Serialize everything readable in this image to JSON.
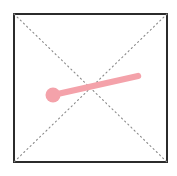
{
  "canvas": {
    "width": 177,
    "height": 176,
    "background_color": "#ffffff"
  },
  "figure": {
    "name": "square-with-diagonals-and-pink-vector",
    "square": {
      "label": "bounding-square",
      "x": 14,
      "y": 14,
      "width": 153,
      "height": 148,
      "stroke_color": "#2b2b2b",
      "stroke_width": 2,
      "fill_color": "#ffffff",
      "corners": {
        "top_left": [
          14,
          14
        ],
        "top_right": [
          167,
          14
        ],
        "bottom_right": [
          167,
          162
        ],
        "bottom_left": [
          14,
          162
        ]
      }
    },
    "diagonals": {
      "label": "dotted-diagonals",
      "stroke_color": "#8a8a8a",
      "stroke_width": 1,
      "dash_pattern": "1,3",
      "lines": [
        {
          "name": "diagonal-tl-br",
          "x1": 14,
          "y1": 14,
          "x2": 167,
          "y2": 162
        },
        {
          "name": "diagonal-tr-bl",
          "x1": 167,
          "y1": 14,
          "x2": 14,
          "y2": 162
        }
      ],
      "intersection": [
        90.5,
        88
      ]
    },
    "vector": {
      "label": "pink-vector-line",
      "color": "#f4a2aa",
      "stroke_width": 6,
      "line_cap": "round",
      "start_point": [
        53,
        95
      ],
      "end_point": [
        138,
        76
      ],
      "length_px": 87,
      "angle_deg": -12.6,
      "marker": {
        "name": "pink-dot-endpoint",
        "center": [
          53,
          95
        ],
        "radius": 7.5,
        "color": "#f4a2aa"
      }
    }
  }
}
